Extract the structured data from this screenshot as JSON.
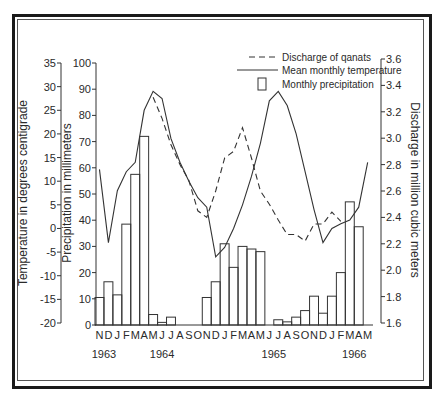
{
  "chart_data": {
    "type": "bar+line",
    "title": "",
    "legend": [
      {
        "label": "Discharge of qanats",
        "style": "dashed-line"
      },
      {
        "label": "Mean monthly temperature",
        "style": "solid-line"
      },
      {
        "label": "Monthly precipitation",
        "style": "bar"
      }
    ],
    "legend_position": "top-right",
    "axes": {
      "temperature": {
        "label": "Temperature in degrees centigrade",
        "ticks": [
          -20,
          -15,
          -10,
          -5,
          0,
          5,
          10,
          15,
          20,
          25,
          30,
          35
        ],
        "range": [
          -20,
          35
        ]
      },
      "precipitation": {
        "label": "Precipitation in millimeters",
        "ticks": [
          0,
          10,
          20,
          30,
          40,
          50,
          60,
          70,
          80,
          90,
          100
        ],
        "range": [
          0,
          100
        ]
      },
      "discharge": {
        "label": "Discharge in million cubic meters",
        "ticks": [
          "1.6",
          "1.8",
          "2.0",
          "2.2",
          "2.4",
          "2.6",
          "2.8",
          "3.0",
          "3.2",
          "3.4",
          "3.6"
        ],
        "range": [
          1.6,
          3.6
        ]
      }
    },
    "categories": [
      "N",
      "D",
      "J",
      "F",
      "M",
      "A",
      "M",
      "J",
      "J",
      "A",
      "S",
      "O",
      "N",
      "D",
      "J",
      "F",
      "M",
      "A",
      "M",
      "J",
      "J",
      "A",
      "S",
      "O",
      "N",
      "D",
      "J",
      "F",
      "M",
      "A",
      "M"
    ],
    "year_labels": [
      {
        "label": "1963",
        "index": 0.5
      },
      {
        "label": "1964",
        "index": 7.0
      },
      {
        "label": "1965",
        "index": 19.5
      },
      {
        "label": "1966",
        "index": 28.5
      }
    ],
    "series": [
      {
        "name": "Monthly precipitation",
        "type": "bar",
        "axis": "precipitation",
        "values": [
          10.5,
          16.5,
          11.5,
          38.5,
          57.5,
          72,
          4,
          1,
          3,
          0,
          0,
          0,
          10.5,
          16.5,
          31,
          22,
          30,
          29,
          28,
          0,
          2,
          1.2,
          3,
          5.5,
          11,
          4.5,
          11,
          20,
          47,
          37.5,
          0
        ]
      },
      {
        "name": "Mean monthly temperature",
        "type": "line",
        "axis": "temperature",
        "values": [
          12.5,
          -3,
          8,
          12,
          14,
          25,
          29,
          27.5,
          19,
          14,
          10,
          6.5,
          4.5,
          -6,
          -4,
          0,
          5,
          11,
          18,
          27,
          29,
          26,
          20,
          12,
          4,
          -3,
          0,
          1,
          1.8,
          4.5,
          14
        ]
      },
      {
        "name": "Discharge of qanats",
        "type": "line",
        "axis": "discharge",
        "values": [
          null,
          null,
          null,
          null,
          null,
          null,
          3.31,
          3.15,
          2.95,
          2.8,
          2.68,
          2.45,
          2.4,
          2.6,
          2.85,
          2.9,
          3.08,
          2.85,
          2.6,
          2.5,
          2.38,
          2.27,
          2.27,
          2.22,
          2.35,
          2.35,
          2.44,
          2.37,
          null,
          null,
          null
        ]
      }
    ]
  }
}
